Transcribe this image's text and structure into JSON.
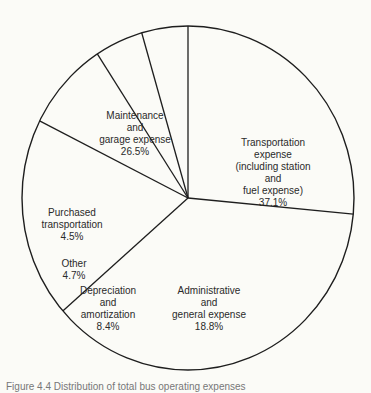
{
  "chart_data": {
    "type": "pie",
    "title": "",
    "caption": "Figure 4.4 Distribution of total bus operating expenses",
    "unit": "%",
    "slices": [
      {
        "name": "Maintenance and garage expense",
        "value": 26.5,
        "label_lines": [
          "Maintenance",
          "and",
          "garage expense",
          "26.5%"
        ]
      },
      {
        "name": "Transportation expense (including station and fuel expense)",
        "value": 37.1,
        "label_lines": [
          "Transportation",
          "expense",
          "(including station",
          "and",
          "fuel expense)",
          "37.1%"
        ]
      },
      {
        "name": "Administrative and general expense",
        "value": 18.8,
        "label_lines": [
          "Administrative",
          "and",
          "general expense",
          "18.8%"
        ]
      },
      {
        "name": "Depreciation and amortization",
        "value": 8.4,
        "label_lines": [
          "Depreciation",
          "and",
          "amortization",
          "8.4%"
        ]
      },
      {
        "name": "Other",
        "value": 4.7,
        "label_lines": [
          "Other",
          "4.7%"
        ]
      },
      {
        "name": "Purchased transportation",
        "value": 4.5,
        "label_lines": [
          "Purchased",
          "transportation",
          "4.5%"
        ]
      }
    ],
    "start_angle_deg": 90,
    "direction": "clockwise",
    "fill": "none",
    "stroke": "#1e1e1e",
    "background": "#fbfbf7"
  }
}
